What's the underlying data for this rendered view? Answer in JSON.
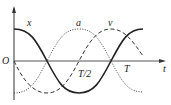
{
  "diagram": {
    "title": "",
    "axes": {
      "origin_label": "O",
      "x_axis_label": "t",
      "ticks": [
        "T/2",
        "T"
      ]
    },
    "curves": [
      {
        "name": "x",
        "label": "x",
        "style": "solid",
        "function": "cos"
      },
      {
        "name": "v",
        "label": "v",
        "style": "dashed",
        "function": "-sin"
      },
      {
        "name": "a",
        "label": "a",
        "style": "dotted",
        "function": "-cos"
      }
    ],
    "colors": {
      "stroke": "#222222",
      "axis": "#444444",
      "background": "#ffffff"
    }
  }
}
